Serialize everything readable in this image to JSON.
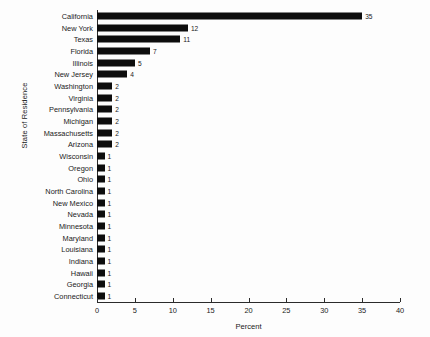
{
  "chart_data": {
    "type": "bar",
    "orientation": "horizontal",
    "title": "",
    "xlabel": "Percent",
    "ylabel": "State of Residence",
    "xlim": [
      0,
      40
    ],
    "xticks": [
      0,
      5,
      10,
      15,
      20,
      25,
      30,
      35,
      40
    ],
    "grid": false,
    "legend": false,
    "bar_color": "#0d0d0d",
    "background_color": "#fdfdfd",
    "axis_color": "#2b2b2b",
    "categories": [
      "California",
      "New York",
      "Texas",
      "Florida",
      "Illinois",
      "New Jersey",
      "Washington",
      "Virginia",
      "Pennsylvania",
      "Michigan",
      "Massachusetts",
      "Arizona",
      "Wisconsin",
      "Oregon",
      "Ohio",
      "North Carolina",
      "New Mexico",
      "Nevada",
      "Minnesota",
      "Maryland",
      "Louisiana",
      "Indiana",
      "Hawaii",
      "Georgia",
      "Connecticut"
    ],
    "values": [
      35,
      12,
      11,
      7,
      5,
      4,
      2,
      2,
      2,
      2,
      2,
      2,
      1,
      1,
      1,
      1,
      1,
      1,
      1,
      1,
      1,
      1,
      1,
      1,
      1
    ],
    "value_labels": [
      "35",
      "12",
      "11",
      "7",
      "5",
      "4",
      "2",
      "2",
      "2",
      "2",
      "2",
      "2",
      "1",
      "1",
      "1",
      "1",
      "1",
      "1",
      "1",
      "1",
      "1",
      "1",
      "1",
      "1",
      "1"
    ]
  }
}
